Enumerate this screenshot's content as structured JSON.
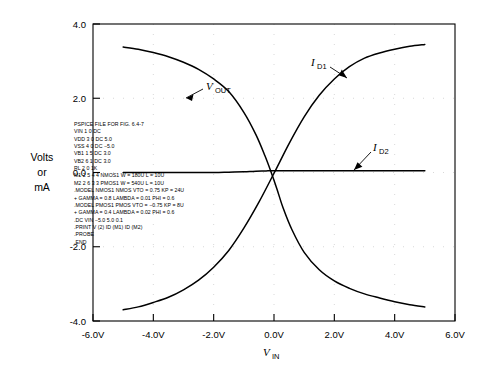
{
  "figure": {
    "y_axis_label_lines": [
      "Volts",
      "or",
      "mA"
    ],
    "x_axis_label_main": "V",
    "x_axis_label_sub": "IN"
  },
  "chart_data": {
    "type": "line",
    "title": "",
    "xlabel": "V_IN",
    "ylabel": "Volts or mA",
    "xlim": [
      -6.0,
      6.0
    ],
    "ylim": [
      -4.0,
      4.0
    ],
    "grid": true,
    "grid_style": "dotted",
    "legend": "inline-annotations",
    "xticks": [
      -6.0,
      -4.0,
      -2.0,
      0.0,
      2.0,
      4.0,
      6.0
    ],
    "xticklabels": [
      "-6.0V",
      "-4.0V",
      "-2.0V",
      "0.0V",
      "2.0V",
      "4.0V",
      "6.0V"
    ],
    "yticks": [
      -4.0,
      -2.0,
      0.0,
      2.0,
      4.0
    ],
    "yticklabels": [
      "-4.0",
      "-2.0",
      "0.0",
      "2.0",
      "4.0"
    ],
    "series": [
      {
        "name": "V_OUT",
        "label_main": "V",
        "label_sub": "OUT",
        "x": [
          -5.0,
          -4.5,
          -4.0,
          -3.5,
          -3.0,
          -2.5,
          -2.0,
          -1.5,
          -1.0,
          -0.6,
          -0.3,
          -0.1,
          0.1,
          0.3,
          0.6,
          1.0,
          1.5,
          2.0,
          2.5,
          3.0,
          3.5,
          4.0,
          4.5,
          5.0
        ],
        "y": [
          3.38,
          3.32,
          3.23,
          3.12,
          2.97,
          2.78,
          2.52,
          2.18,
          1.62,
          1.02,
          0.45,
          0.02,
          -0.45,
          -0.95,
          -1.55,
          -2.15,
          -2.62,
          -2.92,
          -3.12,
          -3.27,
          -3.38,
          -3.48,
          -3.56,
          -3.62
        ]
      },
      {
        "name": "I_D1",
        "label_main": "I",
        "label_sub": "D1",
        "x": [
          -5.0,
          -4.5,
          -4.0,
          -3.5,
          -3.0,
          -2.5,
          -2.0,
          -1.5,
          -1.0,
          -0.5,
          0.0,
          0.5,
          1.0,
          1.5,
          2.0,
          2.5,
          3.0,
          3.5,
          4.0,
          4.5,
          5.0
        ],
        "y": [
          -3.7,
          -3.62,
          -3.5,
          -3.36,
          -3.16,
          -2.9,
          -2.55,
          -2.1,
          -1.5,
          -0.8,
          -0.02,
          0.78,
          1.5,
          2.08,
          2.52,
          2.85,
          3.08,
          3.22,
          3.32,
          3.4,
          3.45
        ]
      },
      {
        "name": "I_D2",
        "label_main": "I",
        "label_sub": "D2",
        "x": [
          -5.0,
          -4.0,
          -3.0,
          -2.0,
          -1.5,
          -1.0,
          -0.7,
          -0.4,
          -0.2,
          0.0,
          0.3,
          0.7,
          1.2,
          2.0,
          3.0,
          4.0,
          5.0
        ],
        "y": [
          0.0,
          0.0,
          0.0,
          0.0,
          0.01,
          0.02,
          0.03,
          0.04,
          0.045,
          0.05,
          0.05,
          0.05,
          0.05,
          0.05,
          0.05,
          0.05,
          0.05
        ]
      }
    ],
    "annotations": [
      {
        "text": "V_OUT",
        "x": -1.6,
        "y": 2.95
      },
      {
        "text": "I_D1",
        "x": 1.55,
        "y": 3.25
      },
      {
        "text": "I_D2",
        "x": 2.9,
        "y": 0.72
      }
    ]
  },
  "netlist": {
    "lines": [
      "PSPICE FILE FOR FIG. 6.4-7",
      "VIN  1  0  DC",
      "VDD  3  0  DC  5.0",
      "VSS  4  0  DC  −5.0",
      "VB1  1  5  DC  3.0",
      "VB2  6  1  DC  3.0",
      "RL  2  0  1K",
      "M1  2  5  4  4     NMOS1  W = 180U  L = 10U",
      "M2  2  6  3  3     PMOS1  W = 540U  L = 10U",
      ".MODEL NMOS1 NMOS  VTO = 0.75  KP = 24U",
      "+ GAMMA = 0.8  LAMBDA = 0.01  PHI = 0.6",
      ".MODEL PMOS1  PMOS  VTO = −0.75  KP = 8U",
      "+ GAMMA = 0.4  LAMBDA = 0.02  PHI = 0.6",
      ".DC VIN  −5.0  5.0  0.1",
      ".PRINT   V (2)  ID (M1)  ID (M2)",
      ".PROBE",
      ".END"
    ]
  }
}
